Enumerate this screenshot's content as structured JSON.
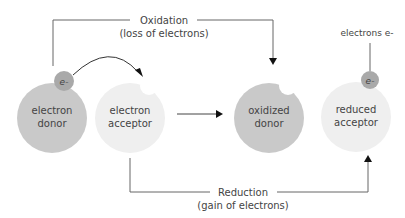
{
  "diagram": {
    "oxidation": {
      "title": "Oxidation",
      "subtitle": "(loss of electrons)"
    },
    "reduction": {
      "title": "Reduction",
      "subtitle": "(gain of electrons)"
    },
    "electrons_label": "electrons e-",
    "electron_symbol": "e-",
    "nodes": [
      {
        "id": "electron-donor",
        "line1": "electron",
        "line2": "donor"
      },
      {
        "id": "electron-acceptor",
        "line1": "electron",
        "line2": "acceptor"
      },
      {
        "id": "oxidized-donor",
        "line1": "oxidized",
        "line2": "donor"
      },
      {
        "id": "reduced-acceptor",
        "line1": "reduced",
        "line2": "acceptor"
      }
    ],
    "colors": {
      "dark_circle": "#c9c9c9",
      "light_circle": "#efefef",
      "electron": "#a9a9a9",
      "line": "#666666",
      "arrow": "#111111",
      "text": "#444444"
    }
  }
}
